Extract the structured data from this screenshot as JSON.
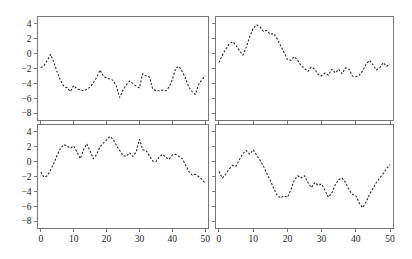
{
  "figure": {
    "title": "",
    "panel_count": 4,
    "layout": "2x2",
    "line_style": "dashed",
    "line_color": "#202020",
    "frame_color": "#777777",
    "background": "#ffffff"
  },
  "axes": {
    "x_ticks": [
      0,
      10,
      20,
      30,
      40,
      50
    ],
    "x_tick_labels": [
      "0",
      "10",
      "20",
      "30",
      "40",
      "50"
    ],
    "y_ticks": [
      4,
      2,
      0,
      -2,
      -4,
      -6,
      -8
    ],
    "y_tick_labels": [
      "4",
      "2",
      "0",
      "−2",
      "−4",
      "−6",
      "−8"
    ],
    "xlim": [
      -1,
      51
    ],
    "ylim": [
      -9,
      5
    ],
    "xlabel": "",
    "ylabel": "",
    "grid": false
  },
  "chart_data": [
    {
      "type": "line",
      "panel": "top-left",
      "title": "",
      "xlabel": "",
      "ylabel": "",
      "xlim": [
        -1,
        51
      ],
      "ylim": [
        -9,
        5
      ],
      "grid": false,
      "legend": "none",
      "x": [
        0,
        1,
        2,
        3,
        4,
        5,
        6,
        7,
        8,
        9,
        10,
        11,
        12,
        13,
        14,
        15,
        16,
        17,
        18,
        19,
        20,
        21,
        22,
        23,
        24,
        25,
        26,
        27,
        28,
        29,
        30,
        31,
        32,
        33,
        34,
        35,
        36,
        37,
        38,
        39,
        40,
        41,
        42,
        43,
        44,
        45,
        46,
        47,
        48,
        49,
        50
      ],
      "series": [
        {
          "name": "series 1",
          "values": [
            -1.9,
            -1.6,
            -0.9,
            -0.1,
            -1.2,
            -2.5,
            -3.6,
            -4.4,
            -4.6,
            -5.1,
            -4.3,
            -4.7,
            -4.9,
            -5.0,
            -4.8,
            -4.5,
            -3.9,
            -3.2,
            -2.2,
            -3.0,
            -3.3,
            -3.4,
            -3.6,
            -4.4,
            -5.9,
            -4.9,
            -4.2,
            -3.7,
            -4.0,
            -4.4,
            -4.6,
            -2.7,
            -3.0,
            -3.1,
            -4.7,
            -5.0,
            -5.0,
            -4.9,
            -5.0,
            -4.5,
            -3.5,
            -2.0,
            -1.7,
            -2.4,
            -3.3,
            -4.5,
            -5.1,
            -5.5,
            -4.2,
            -3.5,
            -3.0
          ]
        }
      ]
    },
    {
      "type": "line",
      "panel": "top-right",
      "title": "",
      "xlabel": "",
      "ylabel": "",
      "xlim": [
        -1,
        51
      ],
      "ylim": [
        -9,
        5
      ],
      "grid": false,
      "legend": "none",
      "x": [
        0,
        1,
        2,
        3,
        4,
        5,
        6,
        7,
        8,
        9,
        10,
        11,
        12,
        13,
        14,
        15,
        16,
        17,
        18,
        19,
        20,
        21,
        22,
        23,
        24,
        25,
        26,
        27,
        28,
        29,
        30,
        31,
        32,
        33,
        34,
        35,
        36,
        37,
        38,
        39,
        40,
        41,
        42,
        43,
        44,
        45,
        46,
        47,
        48,
        49,
        50
      ],
      "series": [
        {
          "name": "series 2",
          "values": [
            -1.2,
            -0.2,
            0.6,
            1.3,
            1.6,
            1.1,
            0.4,
            -0.2,
            0.9,
            2.3,
            3.4,
            3.9,
            3.6,
            3.0,
            3.1,
            2.6,
            2.7,
            2.0,
            1.1,
            0.2,
            -0.8,
            -0.9,
            -0.4,
            -0.9,
            -1.6,
            -2.0,
            -2.4,
            -1.8,
            -2.1,
            -2.8,
            -3.0,
            -2.6,
            -2.9,
            -2.1,
            -2.6,
            -2.1,
            -2.7,
            -1.9,
            -2.1,
            -3.0,
            -3.1,
            -2.9,
            -2.3,
            -1.4,
            -0.9,
            -1.5,
            -2.2,
            -1.9,
            -1.2,
            -1.7,
            -1.4
          ]
        }
      ]
    },
    {
      "type": "line",
      "panel": "bottom-left",
      "title": "",
      "xlabel": "",
      "ylabel": "",
      "xlim": [
        -1,
        51
      ],
      "ylim": [
        -9,
        5
      ],
      "grid": false,
      "legend": "none",
      "x": [
        0,
        1,
        2,
        3,
        4,
        5,
        6,
        7,
        8,
        9,
        10,
        11,
        12,
        13,
        14,
        15,
        16,
        17,
        18,
        19,
        20,
        21,
        22,
        23,
        24,
        25,
        26,
        27,
        28,
        29,
        30,
        31,
        32,
        33,
        34,
        35,
        36,
        37,
        38,
        39,
        40,
        41,
        42,
        43,
        44,
        45,
        46,
        47,
        48,
        49,
        50
      ],
      "series": [
        {
          "name": "series 3",
          "values": [
            -1.4,
            -2.1,
            -1.9,
            -1.1,
            -0.2,
            0.9,
            1.8,
            2.3,
            2.1,
            1.8,
            2.1,
            1.3,
            0.4,
            1.6,
            2.4,
            1.4,
            0.4,
            1.0,
            2.0,
            2.5,
            2.9,
            3.4,
            3.0,
            2.2,
            1.5,
            0.8,
            0.7,
            1.2,
            0.7,
            1.3,
            3.0,
            1.6,
            1.5,
            0.8,
            0.1,
            0.0,
            0.6,
            1.0,
            0.6,
            0.3,
            0.9,
            1.0,
            0.7,
            0.4,
            -0.4,
            -1.3,
            -1.8,
            -1.7,
            -2.0,
            -2.4,
            -2.9
          ]
        }
      ]
    },
    {
      "type": "line",
      "panel": "bottom-right",
      "title": "",
      "xlabel": "",
      "ylabel": "",
      "xlim": [
        -1,
        51
      ],
      "ylim": [
        -9,
        5
      ],
      "grid": false,
      "legend": "none",
      "x": [
        0,
        1,
        2,
        3,
        4,
        5,
        6,
        7,
        8,
        9,
        10,
        11,
        12,
        13,
        14,
        15,
        16,
        17,
        18,
        19,
        20,
        21,
        22,
        23,
        24,
        25,
        26,
        27,
        28,
        29,
        30,
        31,
        32,
        33,
        34,
        35,
        36,
        37,
        38,
        39,
        40,
        41,
        42,
        43,
        44,
        45,
        46,
        47,
        48,
        49,
        50
      ],
      "series": [
        {
          "name": "series 4",
          "values": [
            -1.3,
            -2.2,
            -1.7,
            -1.0,
            -0.5,
            -0.6,
            0.3,
            1.1,
            1.5,
            1.0,
            1.6,
            0.9,
            0.2,
            -0.6,
            -1.6,
            -2.5,
            -3.6,
            -4.5,
            -4.9,
            -4.6,
            -4.8,
            -3.8,
            -2.5,
            -1.9,
            -2.2,
            -1.9,
            -2.8,
            -3.5,
            -2.8,
            -3.2,
            -3.0,
            -3.9,
            -4.8,
            -4.2,
            -3.1,
            -2.4,
            -2.2,
            -2.8,
            -3.8,
            -4.4,
            -4.6,
            -5.6,
            -6.2,
            -5.4,
            -4.4,
            -3.6,
            -2.8,
            -2.2,
            -1.6,
            -0.9,
            -0.4
          ]
        }
      ]
    }
  ]
}
